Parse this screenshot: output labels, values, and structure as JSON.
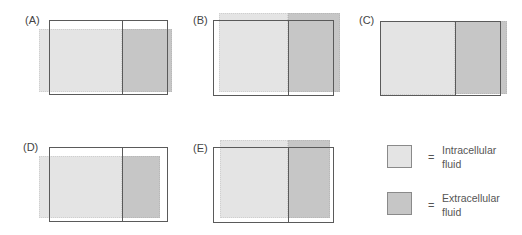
{
  "colors": {
    "intracellular": "#e4e4e4",
    "extracellular": "#c6c6c6",
    "outline": "#5a5a5a"
  },
  "panels": [
    {
      "label": "(A)",
      "description": "ICF and ECF both expanded laterally; volume shifted left and right, lower top"
    },
    {
      "label": "(B)",
      "description": "Both compartments raised above outline, ECF expanded right"
    },
    {
      "label": "(C)",
      "description": "ICF unchanged, ECF expanded right"
    },
    {
      "label": "(D)",
      "description": "ICF expanded left, ECF contracted, lower top"
    },
    {
      "label": "(E)",
      "description": "Both raised, ICF shifted right, ECF contracted"
    }
  ],
  "legend": {
    "items": [
      {
        "symbol": "=",
        "line1": "Intracellular",
        "line2": "fluid"
      },
      {
        "symbol": "=",
        "line1": "Extracellular",
        "line2": "fluid"
      }
    ]
  }
}
